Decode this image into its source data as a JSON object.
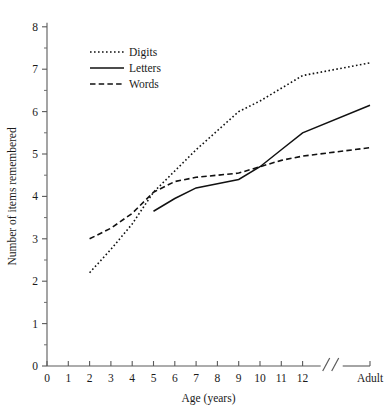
{
  "chart_data": {
    "type": "line",
    "title": "",
    "xlabel": "Age (years)",
    "ylabel": "Number of items remembered",
    "ylim": [
      0,
      8
    ],
    "yticks": [
      0,
      1,
      2,
      3,
      4,
      5,
      6,
      7,
      8
    ],
    "ytick_labels": [
      "0",
      "1",
      "2",
      "3",
      "4",
      "5",
      "6",
      "7",
      "8"
    ],
    "xticks": [
      0,
      1,
      2,
      3,
      4,
      5,
      6,
      7,
      8,
      9,
      10,
      11,
      12,
      14
    ],
    "xtick_labels": [
      "0",
      "1",
      "2",
      "3",
      "4",
      "5",
      "6",
      "7",
      "8",
      "9",
      "10",
      "11",
      "12",
      "Adult"
    ],
    "axis_break": {
      "present": true,
      "between": [
        "12",
        "Adult"
      ],
      "symbol": "//"
    },
    "grid": false,
    "legend_position": "upper-left",
    "minor_ticks": true,
    "series": [
      {
        "name": "Digits",
        "style": "dotted",
        "color": "#111111",
        "x": [
          2,
          3,
          4,
          5,
          6,
          7,
          8,
          9,
          10,
          11,
          12,
          14
        ],
        "values": [
          2.2,
          2.75,
          3.35,
          4.1,
          4.6,
          5.1,
          5.55,
          6.0,
          6.25,
          6.55,
          6.85,
          7.15
        ]
      },
      {
        "name": "Letters",
        "style": "solid",
        "color": "#111111",
        "x": [
          5,
          6,
          7,
          8,
          9,
          10,
          11,
          12,
          14
        ],
        "values": [
          3.65,
          3.95,
          4.2,
          4.3,
          4.4,
          4.7,
          5.1,
          5.5,
          6.15
        ]
      },
      {
        "name": "Words",
        "style": "dashed",
        "color": "#111111",
        "x": [
          2,
          3,
          4,
          5,
          6,
          7,
          8,
          9,
          10,
          11,
          12,
          14
        ],
        "values": [
          3.0,
          3.25,
          3.6,
          4.1,
          4.35,
          4.45,
          4.5,
          4.55,
          4.7,
          4.85,
          4.95,
          5.15
        ]
      }
    ]
  },
  "legend": {
    "items": [
      {
        "label": "Digits"
      },
      {
        "label": "Letters"
      },
      {
        "label": "Words"
      }
    ]
  },
  "axes": {
    "x_title": "Age (years)",
    "y_title": "Number of items remembered",
    "break_symbol": "//"
  }
}
